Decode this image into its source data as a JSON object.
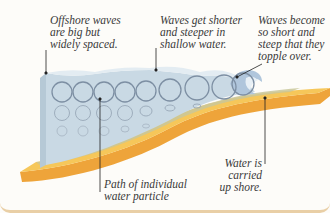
{
  "labels": {
    "offshore": "Offshore waves\nare big but\nwidely spaced.",
    "shallow": "Waves get shorter\nand steeper in\nshallow water.",
    "topple": "Waves become\nso short and\nsteep that they\ntopple over.",
    "path": "Path of individual\nwater particle",
    "carried": "Water is carried\nup shore."
  },
  "colors": {
    "water_front": "#c9d9e4",
    "water_top": "#dde8ef",
    "sand_top": "#f6c75a",
    "sand_side": "#eea43a",
    "circle": "#7d8fa3",
    "leader": "#222222",
    "border": "#e9cfa6"
  },
  "icons": {
    "orbit": "circle-orbit-icon",
    "breaking_wave": "breaking-wave-icon"
  }
}
